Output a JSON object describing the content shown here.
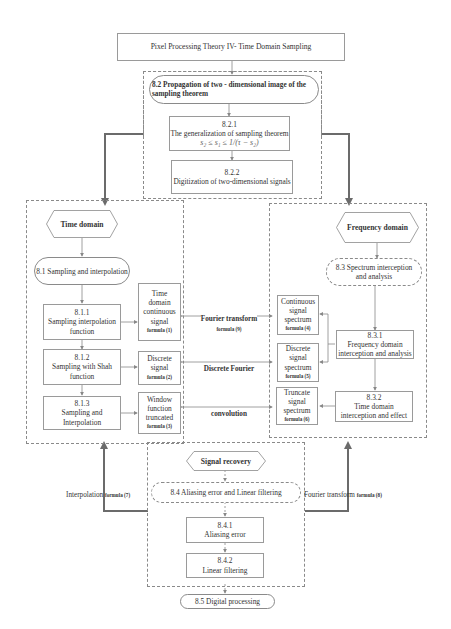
{
  "title": "Pixel Processing Theory IV- Time Domain Sampling",
  "section_8_2": {
    "title": "8.2 Propagation of two - dimensional image of the sampling theorem",
    "sub1": {
      "number": "8.2.1",
      "label": "The generalization of sampling theorem",
      "formula": "s₂ ≤ s₁ ≤ 1/(τ − s₂)"
    },
    "sub2": {
      "number": "8.2.2",
      "label": "Digitization of two-dimensional signals"
    }
  },
  "time_domain": {
    "header": "Time domain",
    "section": "8.1 Sampling and interpolation",
    "items": [
      {
        "number": "8.1.1",
        "label": "Sampling interpolation function",
        "result": "Time domain continuous signal",
        "formula": "formula (1)"
      },
      {
        "number": "8.1.2",
        "label": "Sampling with Shah function",
        "result": "Discrete signal",
        "formula": "formula (2)"
      },
      {
        "number": "8.1.3",
        "label": "Sampling and Interpolation",
        "result": "Window function truncated",
        "formula": "formula (3)"
      }
    ]
  },
  "links": [
    {
      "label": "Fourier transform",
      "formula": "formula (9)"
    },
    {
      "label": "Discrete Fourier",
      "formula": ""
    },
    {
      "label": "convolution",
      "formula": ""
    }
  ],
  "frequency_domain": {
    "header": "Frequency domain",
    "section": "8.3 Spectrum interception and analysis",
    "spectra": [
      {
        "label": "Continuous signal spectrum",
        "formula": "formula (4)"
      },
      {
        "label": "Discrete signal spectrum",
        "formula": "formula (5)"
      },
      {
        "label": "Truncate signal spectrum",
        "formula": "formula (6)"
      }
    ],
    "sub1": {
      "number": "8.3.1",
      "label": "Frequency domain interception and analysis"
    },
    "sub2": {
      "number": "8.3.2",
      "label": "Time domain interception and effect"
    }
  },
  "signal_recovery": {
    "header": "Signal recovery",
    "section": "8.4 Aliasing error and Linear filtering",
    "sub1": {
      "number": "8.4.1",
      "label": "Aliasing error"
    },
    "sub2": {
      "number": "8.4.2",
      "label": "Linear filtering"
    },
    "left_link": {
      "label": "Interpolation",
      "formula": "formula (7)"
    },
    "right_link": {
      "label": "Fourier transform",
      "formula": "formula (8)"
    }
  },
  "final": "8.5 Digital processing",
  "colors": {
    "thick_arrow": "#6b6b6b",
    "thin_line": "#8a8a8a",
    "border": "#9a9a9a"
  }
}
